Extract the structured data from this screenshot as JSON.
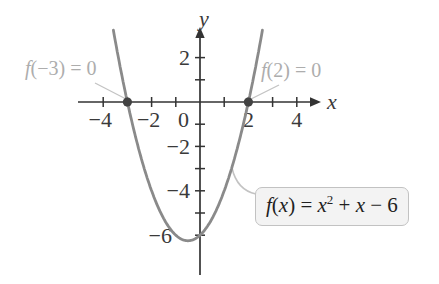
{
  "figure": {
    "background": "#ffffff"
  },
  "chart_data": {
    "type": "line",
    "title": "",
    "function_expression": "f(x) = x^2 + x - 6",
    "coefficients": {
      "a": 1,
      "b": 1,
      "c": -6
    },
    "plot_domain": [
      -3.58,
      2.58
    ],
    "sample_points": {
      "x": [
        -3.5,
        -3,
        -2,
        -1,
        -0.5,
        0,
        1,
        2,
        2.5
      ],
      "y": [
        2.75,
        0,
        -4,
        -6,
        -6.25,
        -6,
        -4,
        0,
        2.75
      ]
    },
    "vertex": {
      "x": -0.5,
      "y": -6.25
    },
    "zeros": [
      {
        "x": -3,
        "y": 0
      },
      {
        "x": 2,
        "y": 0
      }
    ],
    "grid": false,
    "x_axis": {
      "label": "x",
      "range": [
        -5,
        4.8
      ],
      "ticks": [
        -4,
        -3,
        -2,
        -1,
        1,
        2,
        3,
        4
      ],
      "tick_labels": [
        {
          "v": -4,
          "t": "−4"
        },
        {
          "v": -2,
          "t": "−2"
        },
        {
          "v": 2,
          "t": "2"
        },
        {
          "v": 4,
          "t": "4"
        }
      ]
    },
    "y_axis": {
      "label": "y",
      "range": [
        -7.8,
        3.3
      ],
      "ticks": [
        2,
        1,
        -1,
        -2,
        -3,
        -4,
        -5,
        -6
      ],
      "tick_labels": [
        {
          "v": 2,
          "t": "2"
        },
        {
          "v": -2,
          "t": "−2"
        },
        {
          "v": -4,
          "t": "−4"
        },
        {
          "v": -6,
          "t": "−6",
          "xEnd": 172
        }
      ]
    },
    "origin_label": "0",
    "colors": {
      "curve": "#8a8a8a",
      "axis": "#333333",
      "tick_text": "#3a3a3a",
      "point": "#424242",
      "leader": "#c3c3c3",
      "annotation_text": "#adadad",
      "equation_text": "#1f1f1f",
      "equation_box_bg": "#f3f3f3",
      "equation_box_border": "#c2c2c2"
    }
  },
  "annotations": {
    "left_zero": {
      "segments": [
        {
          "t": "f",
          "i": true
        },
        {
          "t": "(−3) = 0"
        }
      ]
    },
    "right_zero": {
      "segments": [
        {
          "t": "f",
          "i": true
        },
        {
          "t": "(2) = 0"
        }
      ]
    },
    "equation": {
      "segments": [
        {
          "t": "f",
          "i": true
        },
        {
          "t": "("
        },
        {
          "t": "x",
          "i": true
        },
        {
          "t": ") = "
        },
        {
          "t": "x",
          "i": true
        },
        {
          "t": "2",
          "sup": true
        },
        {
          "t": " + "
        },
        {
          "t": "x",
          "i": true
        },
        {
          "t": " − 6"
        }
      ]
    }
  }
}
